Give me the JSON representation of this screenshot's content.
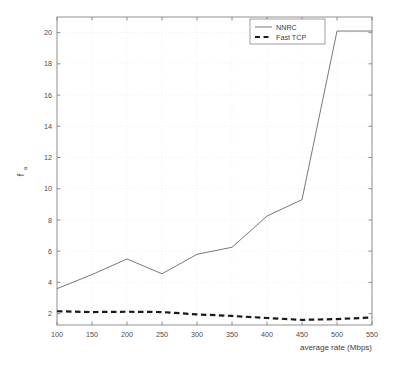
{
  "chart_data": {
    "type": "line",
    "title": "",
    "xlabel": "average rate (Mbps)",
    "ylabel": "f",
    "ylabel_sub": "a",
    "x": [
      100,
      150,
      200,
      250,
      300,
      350,
      400,
      450,
      500,
      550
    ],
    "xlim": [
      100,
      550
    ],
    "ylim": [
      1.27,
      21.0
    ],
    "xticks": [
      100,
      150,
      200,
      250,
      300,
      350,
      400,
      450,
      500,
      550
    ],
    "xtick_labels": [
      "100",
      "150",
      "200",
      "250",
      "300",
      "350",
      "400",
      "450",
      "500",
      "550"
    ],
    "yticks": [
      2,
      4,
      6,
      8,
      10,
      12,
      14,
      16,
      18,
      20
    ],
    "ytick_labels": [
      "2",
      "4",
      "6",
      "8",
      "10",
      "12",
      "14",
      "16",
      "18",
      "20"
    ],
    "grid": true,
    "legend_position": "top-right-inside",
    "series": [
      {
        "name": "NNRC",
        "style": "solid",
        "color": "#555555",
        "width": 0.8,
        "values": [
          3.6,
          4.5,
          5.5,
          4.55,
          5.8,
          6.25,
          8.25,
          9.3,
          20.1,
          20.1
        ]
      },
      {
        "name": "Fast TCP",
        "style": "dashed",
        "color": "#1a1a1a",
        "width": 2.2,
        "values": [
          2.15,
          2.1,
          2.12,
          2.1,
          1.95,
          1.85,
          1.72,
          1.6,
          1.65,
          1.75
        ]
      }
    ]
  },
  "legend": {
    "entries": [
      {
        "label": "NNRC"
      },
      {
        "label": "Fast TCP"
      }
    ]
  },
  "colors": {
    "axis": "#777777",
    "grid": "#ededed",
    "text": "#3c3c3c",
    "background": "#ffffff",
    "nnrc": "#555555",
    "fasttcp": "#1a1a1a"
  }
}
